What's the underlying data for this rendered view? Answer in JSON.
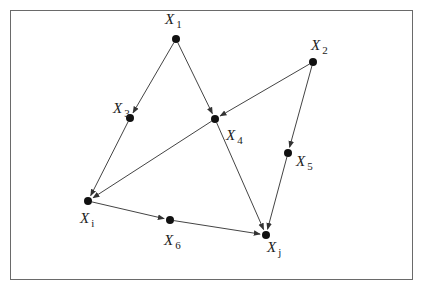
{
  "diagram": {
    "type": "directed-graph",
    "nodes": [
      {
        "id": "X1",
        "label": "X",
        "sub": "1",
        "x": 176,
        "y": 39,
        "lx": 165,
        "ly": 24
      },
      {
        "id": "X2",
        "label": "X",
        "sub": "2",
        "x": 313,
        "y": 62,
        "lx": 311,
        "ly": 50
      },
      {
        "id": "X3",
        "label": "X",
        "sub": "3",
        "x": 130,
        "y": 118,
        "lx": 113,
        "ly": 113
      },
      {
        "id": "X4",
        "label": "X",
        "sub": "4",
        "x": 215,
        "y": 119,
        "lx": 226,
        "ly": 140
      },
      {
        "id": "X5",
        "label": "X",
        "sub": "5",
        "x": 288,
        "y": 153,
        "lx": 296,
        "ly": 166
      },
      {
        "id": "Xi",
        "label": "X",
        "sub": "i",
        "x": 88,
        "y": 201,
        "lx": 80,
        "ly": 223
      },
      {
        "id": "X6",
        "label": "X",
        "sub": "6",
        "x": 170,
        "y": 220,
        "lx": 164,
        "ly": 245
      },
      {
        "id": "Xj",
        "label": "X",
        "sub": "j",
        "x": 266,
        "y": 235,
        "lx": 267,
        "ly": 252
      }
    ],
    "edges": [
      {
        "from": "X1",
        "to": "X3"
      },
      {
        "from": "X1",
        "to": "X4"
      },
      {
        "from": "X2",
        "to": "X4"
      },
      {
        "from": "X2",
        "to": "X5"
      },
      {
        "from": "X3",
        "to": "Xi"
      },
      {
        "from": "X4",
        "to": "Xi"
      },
      {
        "from": "X4",
        "to": "Xj"
      },
      {
        "from": "X5",
        "to": "Xj"
      },
      {
        "from": "Xi",
        "to": "X6"
      },
      {
        "from": "X6",
        "to": "Xj"
      }
    ],
    "colors": {
      "edge": "#444444",
      "node": "#111111",
      "border": "#6a6a6a"
    }
  }
}
